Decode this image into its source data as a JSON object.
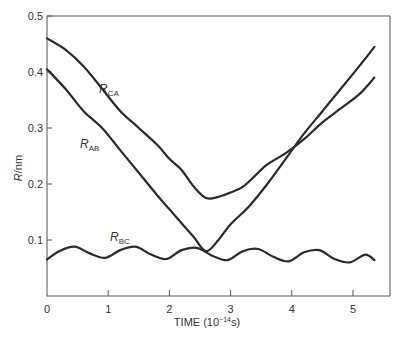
{
  "chart_data": {
    "type": "line",
    "title": "",
    "xlabel": "TIME (10^-14 s)",
    "ylabel": "R/nm",
    "xlim": [
      0,
      5.6
    ],
    "ylim": [
      0,
      0.5
    ],
    "xticks": [
      "0",
      "1",
      "2",
      "3",
      "4",
      "5"
    ],
    "yticks": [
      "0.1",
      "0.2",
      "0.3",
      "0.4",
      "0.5"
    ],
    "grid": false,
    "legend": "inline labels",
    "series": [
      {
        "name": "R_CA",
        "label_main": "R",
        "label_sub": "CA",
        "x": [
          0,
          0.3,
          0.6,
          0.9,
          1.2,
          1.5,
          1.8,
          2.0,
          2.2,
          2.4,
          2.6,
          2.8,
          3.0,
          3.2,
          3.4,
          3.6,
          3.9,
          4.2,
          4.5,
          4.8,
          5.1,
          5.35
        ],
        "y": [
          0.46,
          0.44,
          0.41,
          0.37,
          0.33,
          0.3,
          0.27,
          0.245,
          0.225,
          0.195,
          0.175,
          0.177,
          0.185,
          0.195,
          0.215,
          0.235,
          0.255,
          0.28,
          0.31,
          0.335,
          0.36,
          0.39
        ]
      },
      {
        "name": "R_AB",
        "label_main": "R",
        "label_sub": "AB",
        "x": [
          0,
          0.3,
          0.6,
          0.9,
          1.2,
          1.5,
          1.8,
          2.0,
          2.2,
          2.4,
          2.6,
          2.8,
          3.0,
          3.3,
          3.6,
          3.9,
          4.2,
          4.5,
          4.8,
          5.1,
          5.35
        ],
        "y": [
          0.405,
          0.37,
          0.33,
          0.3,
          0.26,
          0.22,
          0.18,
          0.155,
          0.13,
          0.105,
          0.08,
          0.1,
          0.128,
          0.16,
          0.2,
          0.245,
          0.29,
          0.33,
          0.37,
          0.41,
          0.445
        ]
      },
      {
        "name": "R_BC",
        "label_main": "R",
        "label_sub": "BC",
        "x": [
          0,
          0.2,
          0.45,
          0.7,
          0.95,
          1.2,
          1.45,
          1.7,
          1.95,
          2.2,
          2.45,
          2.7,
          2.95,
          3.2,
          3.45,
          3.7,
          3.95,
          4.2,
          4.45,
          4.7,
          4.95,
          5.2,
          5.35
        ],
        "y": [
          0.065,
          0.08,
          0.088,
          0.076,
          0.068,
          0.082,
          0.088,
          0.074,
          0.066,
          0.082,
          0.086,
          0.072,
          0.064,
          0.08,
          0.084,
          0.07,
          0.062,
          0.078,
          0.082,
          0.066,
          0.06,
          0.074,
          0.064
        ]
      }
    ]
  },
  "labels": {
    "ylabel_main": "R",
    "ylabel_unit": "/nm",
    "xlabel_main": "TIME (10",
    "xlabel_exp": "−14",
    "xlabel_unit": "s)"
  }
}
